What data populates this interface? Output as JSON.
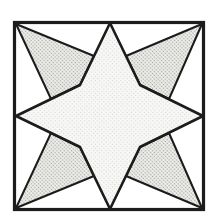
{
  "figure": {
    "canvas": {
      "width": 219,
      "height": 224,
      "background": "#ffffff"
    },
    "ink_color": "#1b1b1b",
    "square": {
      "x": 14.5,
      "y": 22.5,
      "width": 189,
      "height": 187,
      "stroke_width": 3.2
    },
    "star": {
      "points": "110,23 80,85 16,116 80,147 110,209 140,147 203,116 140,85",
      "stroke_width": 2.6,
      "fill_bg": "#f7f7f5",
      "dot_color": "#cfcfcb",
      "dot_tile": 3.0,
      "dot_radius": 0.55
    },
    "dart_style": {
      "stroke_width": 2.0,
      "fill_bg": "#efefec",
      "dot_color": "#a3a39f",
      "dot_tile": 2.6,
      "dot_radius": 0.75
    },
    "darts": [
      {
        "name": "corner-dart-top-left",
        "points": "16,24 94,56 80,85 51,99"
      },
      {
        "name": "corner-dart-top-right",
        "points": "202,24 126,56 140,85 169,99"
      },
      {
        "name": "corner-dart-bottom-left",
        "points": "16,208 94,176 80,147 51,133"
      },
      {
        "name": "corner-dart-bottom-right",
        "points": "202,208 126,176 140,147 169,133"
      }
    ],
    "scan_blur": 0.35
  }
}
